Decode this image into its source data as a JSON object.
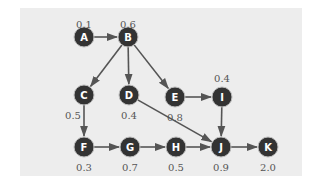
{
  "diagram": {
    "type": "directed-acyclic-graph",
    "colors": {
      "background": "#ededed",
      "node_fill": "#333333",
      "node_stroke": "#bdbdbd",
      "edge": "#555555",
      "value_text": "#555555",
      "node_text": "#ffffff"
    },
    "nodes": [
      {
        "id": "A",
        "label": "A",
        "value": "0.1",
        "x": 84,
        "y": 37,
        "vx": 84,
        "vy": 24
      },
      {
        "id": "B",
        "label": "B",
        "value": "0.6",
        "x": 128,
        "y": 37,
        "vx": 128,
        "vy": 24
      },
      {
        "id": "C",
        "label": "C",
        "value": "0.5",
        "x": 84,
        "y": 95,
        "vx": 73,
        "vy": 115
      },
      {
        "id": "D",
        "label": "D",
        "value": "0.4",
        "x": 129,
        "y": 95,
        "vx": 129,
        "vy": 115
      },
      {
        "id": "E",
        "label": "E",
        "value": "0.8",
        "x": 175,
        "y": 97,
        "vx": 175,
        "vy": 117
      },
      {
        "id": "I",
        "label": "I",
        "value": "0.4",
        "x": 222,
        "y": 97,
        "vx": 222,
        "vy": 78
      },
      {
        "id": "F",
        "label": "F",
        "value": "0.3",
        "x": 84,
        "y": 147,
        "vx": 84,
        "vy": 167
      },
      {
        "id": "G",
        "label": "G",
        "value": "0.7",
        "x": 130,
        "y": 147,
        "vx": 130,
        "vy": 167
      },
      {
        "id": "H",
        "label": "H",
        "value": "0.5",
        "x": 176,
        "y": 147,
        "vx": 176,
        "vy": 167
      },
      {
        "id": "J",
        "label": "J",
        "value": "0.9",
        "x": 221,
        "y": 147,
        "vx": 221,
        "vy": 167
      },
      {
        "id": "K",
        "label": "K",
        "value": "2.0",
        "x": 268,
        "y": 147,
        "vx": 268,
        "vy": 167
      }
    ],
    "edges": [
      {
        "from": "A",
        "to": "B"
      },
      {
        "from": "B",
        "to": "C"
      },
      {
        "from": "B",
        "to": "D"
      },
      {
        "from": "B",
        "to": "E"
      },
      {
        "from": "C",
        "to": "F"
      },
      {
        "from": "D",
        "to": "J"
      },
      {
        "from": "E",
        "to": "I"
      },
      {
        "from": "I",
        "to": "J"
      },
      {
        "from": "F",
        "to": "G"
      },
      {
        "from": "G",
        "to": "H"
      },
      {
        "from": "H",
        "to": "J"
      },
      {
        "from": "J",
        "to": "K"
      }
    ]
  }
}
